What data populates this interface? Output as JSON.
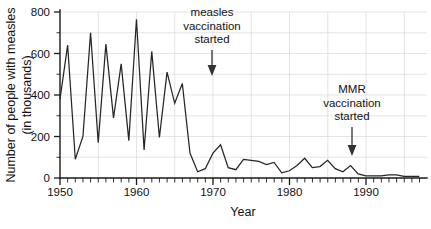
{
  "chart_data": {
    "type": "line",
    "title": "",
    "xlabel": "Year",
    "ylabel_line1": "Number of people with measles",
    "ylabel_line2": "(in thousands)",
    "xlim": [
      1950,
      1998
    ],
    "ylim": [
      0,
      800
    ],
    "grid": true,
    "legend": "none",
    "y_ticks": [
      0,
      200,
      400,
      600,
      800
    ],
    "y_tick_labels": [
      "0",
      "200",
      "400",
      "600",
      "800"
    ],
    "y_gridlines": [
      100,
      200,
      300,
      400,
      500,
      600,
      700,
      800
    ],
    "x_ticks": [
      1950,
      1960,
      1970,
      1980,
      1990
    ],
    "x_tick_labels": [
      "1950",
      "1960",
      "1970",
      "1980",
      "1990"
    ],
    "x_gridlines": [
      1955,
      1960,
      1965,
      1970,
      1975,
      1980,
      1985,
      1990,
      1995
    ],
    "x_minor_tick_step": 1,
    "series_name": "measles cases",
    "line_color": "#262626",
    "x": [
      1950,
      1951,
      1952,
      1953,
      1954,
      1955,
      1956,
      1957,
      1958,
      1959,
      1960,
      1961,
      1962,
      1963,
      1964,
      1965,
      1966,
      1967,
      1968,
      1969,
      1970,
      1971,
      1972,
      1973,
      1974,
      1975,
      1976,
      1977,
      1978,
      1979,
      1980,
      1981,
      1982,
      1983,
      1984,
      1985,
      1986,
      1987,
      1988,
      1989,
      1990,
      1991,
      1992,
      1993,
      1994,
      1995,
      1996,
      1997
    ],
    "values": [
      380,
      640,
      90,
      200,
      700,
      170,
      645,
      290,
      550,
      180,
      765,
      135,
      610,
      195,
      510,
      360,
      455,
      120,
      30,
      45,
      120,
      160,
      50,
      40,
      90,
      85,
      80,
      65,
      75,
      25,
      35,
      60,
      95,
      50,
      55,
      85,
      45,
      30,
      60,
      20,
      10,
      10,
      10,
      15,
      15,
      8,
      8,
      8
    ],
    "annotations": [
      {
        "name": "measles-vaccination-annotation",
        "text_lines": [
          "measles",
          "vaccination",
          "started"
        ],
        "arrow_year": 1970,
        "arrow_top_value": 640,
        "arrow_bottom_value": 500
      },
      {
        "name": "mmr-vaccination-annotation",
        "text_lines": [
          "MMR",
          "vaccination",
          "started"
        ],
        "arrow_year": 1988,
        "arrow_top_value": 255,
        "arrow_bottom_value": 115
      }
    ]
  }
}
